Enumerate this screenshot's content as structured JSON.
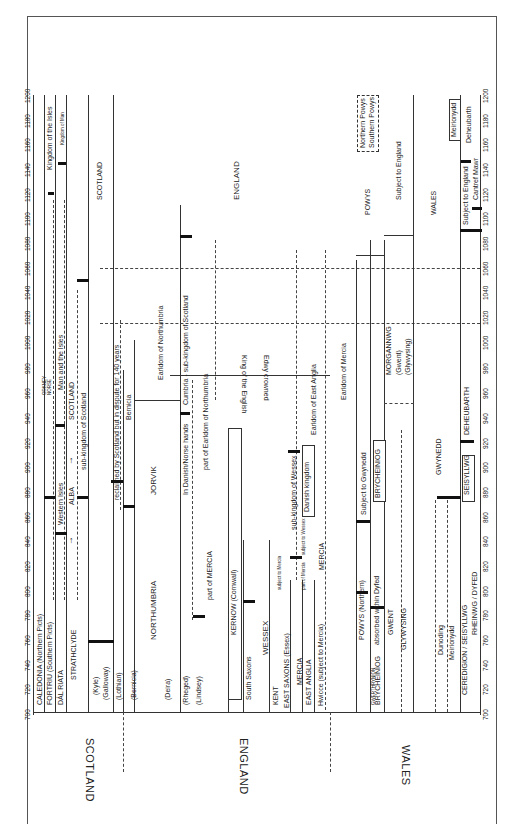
{
  "figure": {
    "orientation": "rotated 90deg counter-clockwise; time axis runs bottom (700) to top (1200)",
    "axis_ticks": [
      "700",
      "720",
      "740",
      "760",
      "780",
      "800",
      "820",
      "840",
      "860",
      "880",
      "900",
      "920",
      "940",
      "960",
      "980",
      "1000",
      "1020",
      "1040",
      "1060",
      "1080",
      "1100",
      "1120",
      "1140",
      "1160",
      "1180",
      "1200"
    ],
    "regions": {
      "scotland": "SCOTLAND",
      "england": "ENGLAND",
      "wales": "WALES"
    },
    "scotland": {
      "rows": [
        "CALEDONIA (Northern Picts)",
        "FORTRIU (Southern Picts)",
        "DÁL RIATA",
        "STRATHCLYDE"
      ],
      "sub_labels": [
        "(Kyle)",
        "(Galloway)",
        "(Lothian)",
        "(Bernicia)"
      ],
      "labels": {
        "western_isles": "Western Isles",
        "alba": "ALBA",
        "orkney": "ORKNEY",
        "norse": "NORSE",
        "man_isles": "Man and the Isles",
        "scotland_inner": "SCOTLAND",
        "sub_kingdom": "sub-kingdom of Scotland",
        "kingdom_isles": "Kingdom of the Isles",
        "kingdom_man": "Kingdom of Man",
        "scotland_late": "SCOTLAND"
      }
    },
    "england": {
      "labels": {
        "northumbria": "NORTHUMBRIA",
        "deira": "(Deira)",
        "rheged": "(Rheged)",
        "lindsey": "(Lindsey)",
        "part_mercia": "part of MERCIA",
        "reclaimed": "reclaimed by Scotland but in dispute for 140 years",
        "bernicia": "Bernicia",
        "jorvik": "JORVIK",
        "danish_norse": "In Danish/Norse hands",
        "cumbria": "Cumbria - sub-kingdom of Scotland",
        "earldom_northumbria": "Earldom of Northumbria",
        "part_earldom_northumbria": "part of Earldom of Northumbria",
        "kernow": "KERNOW (Cornwall)",
        "south_saxons": "South Saxons",
        "wessex": "WESSEX",
        "king_english": "King of the English",
        "edwy": "Edwy crowned",
        "kent": "KENT",
        "subject_mercia": "subject to Mercia",
        "sub_kingdom_wessex": "sub-kingdom of Wessex",
        "east_saxons": "EAST SAXONS (Essex)",
        "mercia": "MERCIA",
        "part_of_mercia": "part of Mercia",
        "subject_wessex": "subject to Wessex",
        "danish_kingdom": "Danish kingdom",
        "east_anglia": "EAST ANGLIA",
        "earldom_east_anglia": "Earldom of East Anglia",
        "mercia2": "MERCIA",
        "hwicce": "Hwicce (subject to Mercia)",
        "earldom_mercia": "Earldom of Mercia",
        "england_late": "ENGLAND"
      }
    },
    "wales": {
      "labels": {
        "powys_n": "POWYS (Northern)",
        "gwerthrynion": "GWERTHRYNION",
        "brycheiniog": "BRYCHEINIOG",
        "absorbed": "absorbed within Dyfed",
        "subject_gwynedd": "Subject to Gwynedd",
        "brycheiniog2": "BRYCHEINIOG",
        "gwent": "GWENT",
        "glywysing": "GLYWYSING",
        "morgannwg": "MORGANNWG",
        "gwent_p": "(Gwent)",
        "glywysing_p": "(Glywysing)",
        "dunoding": "Dunoding",
        "meirionydd": "Meirionydd",
        "gwynedd": "GWYNEDD",
        "ceredigion": "CEREDIGION / SEISYLLWG",
        "seisyllwg": "SEISYLLWG",
        "deheubarth": "DEHEUBARTH",
        "rheinwg": "RHEINWG / DYFED",
        "powys": "POWYS",
        "subject_england": "Subject to England",
        "wales_inner": "WALES",
        "northern_powys": "Northern Powys",
        "southern_powys": "Southern Powys",
        "subject_england2": "Subject to England",
        "cantref_mawr": "Cantref Mawr",
        "deheubarth2": "Deheubarth",
        "meirionydd2": "Meirionydd"
      }
    }
  }
}
